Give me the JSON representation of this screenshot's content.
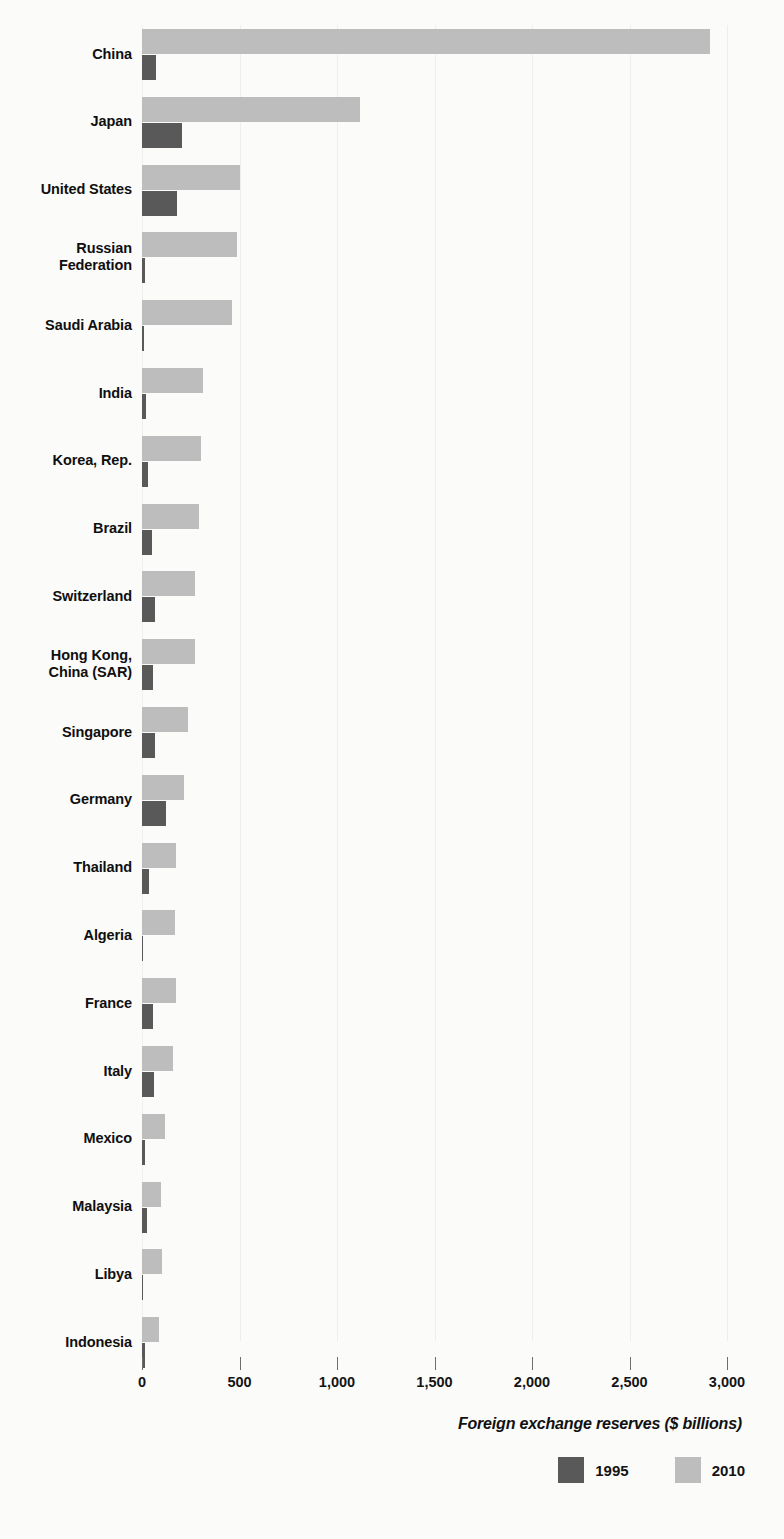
{
  "chart_data": {
    "type": "bar",
    "orientation": "horizontal",
    "title": "",
    "xlabel": "Foreign exchange reserves ($ billions)",
    "ylabel": "",
    "xlim": [
      0,
      3000
    ],
    "xticks": [
      0,
      500,
      1000,
      1500,
      2000,
      2500,
      3000
    ],
    "xtick_labels": [
      "0",
      "500",
      "1,000",
      "1,500",
      "2,000",
      "2,500",
      "3,000"
    ],
    "grid": true,
    "legend_position": "bottom-right",
    "categories": [
      "China",
      "Japan",
      "United States",
      "Russian Federation",
      "Saudi Arabia",
      "India",
      "Korea, Rep.",
      "Brazil",
      "Switzerland",
      "Hong Kong, China (SAR)",
      "Singapore",
      "Germany",
      "Thailand",
      "Algeria",
      "France",
      "Italy",
      "Mexico",
      "Malaysia",
      "Libya",
      "Indonesia"
    ],
    "category_label_lines": [
      [
        "China"
      ],
      [
        "Japan"
      ],
      [
        "United States"
      ],
      [
        "Russian",
        "Federation"
      ],
      [
        "Saudi Arabia"
      ],
      [
        "India"
      ],
      [
        "Korea, Rep."
      ],
      [
        "Brazil"
      ],
      [
        "Switzerland"
      ],
      [
        "Hong Kong,",
        "China (SAR)"
      ],
      [
        "Singapore"
      ],
      [
        "Germany"
      ],
      [
        "Thailand"
      ],
      [
        "Algeria"
      ],
      [
        "France"
      ],
      [
        "Italy"
      ],
      [
        "Mexico"
      ],
      [
        "Malaysia"
      ],
      [
        "Libya"
      ],
      [
        "Indonesia"
      ]
    ],
    "series": [
      {
        "name": "1995",
        "color": "#595959",
        "values": [
          74,
          205,
          180,
          15,
          8,
          18,
          32,
          50,
          66,
          55,
          69,
          123,
          36,
          2,
          55,
          61,
          16,
          24,
          6,
          14
        ]
      },
      {
        "name": "2010",
        "color": "#bdbdbd",
        "values": [
          2914,
          1118,
          503,
          487,
          462,
          313,
          303,
          293,
          272,
          272,
          236,
          216,
          174,
          169,
          174,
          161,
          118,
          97,
          102,
          87
        ]
      }
    ]
  },
  "legend": {
    "items": [
      {
        "label": "1995",
        "color": "#595959"
      },
      {
        "label": "2010",
        "color": "#bdbdbd"
      }
    ]
  },
  "axis": {
    "title": "Foreign exchange reserves ($ billions)"
  }
}
